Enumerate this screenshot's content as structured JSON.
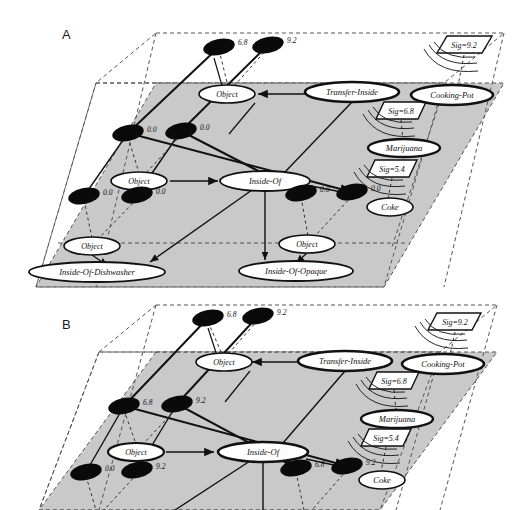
{
  "figure": {
    "type": "layered-semantic-network-diagram",
    "panels": [
      {
        "id": "A",
        "letter": "A",
        "planes": [
          {
            "name": "input-plane",
            "fill": "none",
            "style": "dashed-outline"
          },
          {
            "name": "middle-plane",
            "fill": "#c8c8c8",
            "style": "shaded"
          },
          {
            "name": "output-plane",
            "fill": "none",
            "style": "dashed-outline"
          }
        ],
        "activation_nodes": [
          {
            "id": "a-top-1",
            "value": "6.8",
            "x": 219,
            "y": 47
          },
          {
            "id": "a-top-2",
            "value": "9.2",
            "x": 268,
            "y": 45
          },
          {
            "id": "a-mid-1",
            "value": "0.0",
            "x": 128,
            "y": 133
          },
          {
            "id": "a-mid-2",
            "value": "0.0",
            "x": 181,
            "y": 131
          },
          {
            "id": "a-low-1",
            "value": "0.0",
            "x": 84,
            "y": 196
          },
          {
            "id": "a-low-2",
            "value": "0.0",
            "x": 137,
            "y": 195
          },
          {
            "id": "a-low-3",
            "value": "0.0",
            "x": 301,
            "y": 193
          },
          {
            "id": "a-low-4",
            "value": "0.0",
            "x": 352,
            "y": 192
          }
        ],
        "concept_nodes": [
          {
            "id": "a-object-1",
            "label": "Object",
            "x": 227,
            "y": 94,
            "rx": 28,
            "ry": 9,
            "bold": false
          },
          {
            "id": "a-transfer-inside",
            "label": "Transfer-Inside",
            "x": 352,
            "y": 92,
            "rx": 47,
            "ry": 10,
            "bold": true
          },
          {
            "id": "a-cooking-pot",
            "label": "Cooking-Pot",
            "x": 452,
            "y": 95,
            "rx": 41,
            "ry": 10,
            "bold": true
          },
          {
            "id": "a-marijuana",
            "label": "Marijuana",
            "x": 404,
            "y": 148,
            "rx": 36,
            "ry": 9,
            "bold": true
          },
          {
            "id": "a-coke",
            "label": "Coke",
            "x": 390,
            "y": 207,
            "rx": 23,
            "ry": 9,
            "bold": false
          },
          {
            "id": "a-object-2",
            "label": "Object",
            "x": 139,
            "y": 181,
            "rx": 28,
            "ry": 9,
            "bold": false
          },
          {
            "id": "a-inside-of",
            "label": "Inside-Of",
            "x": 265,
            "y": 181,
            "rx": 45,
            "ry": 10,
            "bold": false
          },
          {
            "id": "a-object-3",
            "label": "Object",
            "x": 92,
            "y": 246,
            "rx": 28,
            "ry": 9,
            "bold": false
          },
          {
            "id": "a-object-4",
            "label": "Object",
            "x": 307,
            "y": 244,
            "rx": 28,
            "ry": 9,
            "bold": false
          },
          {
            "id": "a-inside-of-dishwasher",
            "label": "Inside-Of-Dishwasher",
            "x": 97,
            "y": 272,
            "rx": 68,
            "ry": 10,
            "bold": false
          },
          {
            "id": "a-inside-of-opaque",
            "label": "Inside-Of-Opaque",
            "x": 296,
            "y": 271,
            "rx": 57,
            "ry": 10,
            "bold": false
          }
        ],
        "signal_boxes": [
          {
            "id": "a-sig-1",
            "label": "Sig=9.2",
            "x": 464,
            "y": 44
          },
          {
            "id": "a-sig-2",
            "label": "Sig=6.8",
            "x": 401,
            "y": 110
          },
          {
            "id": "a-sig-3",
            "label": "Sig=5.4",
            "x": 392,
            "y": 168
          }
        ]
      },
      {
        "id": "B",
        "letter": "B",
        "planes": [
          {
            "name": "input-plane",
            "fill": "none",
            "style": "dashed-outline"
          },
          {
            "name": "middle-plane",
            "fill": "#c8c8c8",
            "style": "shaded"
          },
          {
            "name": "output-plane",
            "fill": "none",
            "style": "dashed-outline"
          }
        ],
        "activation_nodes": [
          {
            "id": "b-top-1",
            "value": "6.8",
            "x": 208,
            "y": 318
          },
          {
            "id": "b-top-2",
            "value": "9.2",
            "x": 258,
            "y": 316
          },
          {
            "id": "b-mid-1",
            "value": "6.8",
            "x": 124,
            "y": 406
          },
          {
            "id": "b-mid-2",
            "value": "9.2",
            "x": 177,
            "y": 404
          },
          {
            "id": "b-low-1",
            "value": "0.0",
            "x": 86,
            "y": 472
          },
          {
            "id": "b-low-2",
            "value": "9.2",
            "x": 137,
            "y": 470
          },
          {
            "id": "b-low-3",
            "value": "6.8",
            "x": 296,
            "y": 468
          },
          {
            "id": "b-low-4",
            "value": "9.2",
            "x": 347,
            "y": 466
          }
        ],
        "concept_nodes": [
          {
            "id": "b-object-1",
            "label": "Object",
            "x": 224,
            "y": 362,
            "rx": 28,
            "ry": 9,
            "bold": false
          },
          {
            "id": "b-transfer-inside",
            "label": "Transfer-Inside",
            "x": 345,
            "y": 361,
            "rx": 47,
            "ry": 10,
            "bold": true
          },
          {
            "id": "b-cooking-pot",
            "label": "Cooking-Pot",
            "x": 443,
            "y": 364,
            "rx": 41,
            "ry": 10,
            "bold": true
          },
          {
            "id": "b-marijuana",
            "label": "Marijuana",
            "x": 397,
            "y": 419,
            "rx": 36,
            "ry": 9,
            "bold": true
          },
          {
            "id": "b-coke",
            "label": "Coke",
            "x": 382,
            "y": 480,
            "rx": 23,
            "ry": 9,
            "bold": false
          },
          {
            "id": "b-object-2",
            "label": "Object",
            "x": 136,
            "y": 452,
            "rx": 28,
            "ry": 9,
            "bold": false
          },
          {
            "id": "b-inside-of",
            "label": "Inside-Of",
            "x": 263,
            "y": 452,
            "rx": 45,
            "ry": 10,
            "bold": true
          }
        ],
        "signal_boxes": [
          {
            "id": "b-sig-1",
            "label": "Sig=9.2",
            "x": 455,
            "y": 321
          },
          {
            "id": "b-sig-2",
            "label": "Sig=6.8",
            "x": 394,
            "y": 380
          },
          {
            "id": "b-sig-3",
            "label": "Sig=5.4",
            "x": 386,
            "y": 437
          }
        ]
      }
    ]
  }
}
